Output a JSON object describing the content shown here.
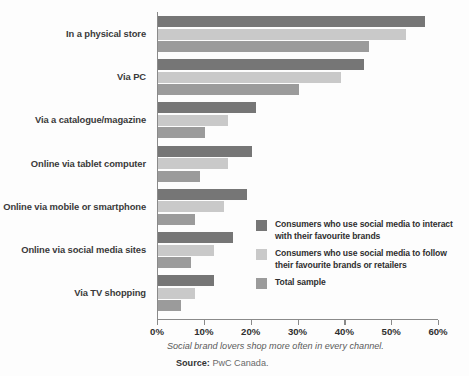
{
  "chart_data": {
    "type": "bar",
    "orientation": "horizontal",
    "title": "",
    "subtitle": "",
    "xlabel": "",
    "ylabel": "",
    "xlim": [
      0,
      60
    ],
    "xticks": [
      0,
      10,
      20,
      30,
      40,
      50,
      60
    ],
    "xtick_labels": [
      "0%",
      "10%",
      "20%",
      "30%",
      "40%",
      "50%",
      "60%"
    ],
    "grid": false,
    "legend_position": "inside-right-middle",
    "categories": [
      "In a physical store",
      "Via PC",
      "Via a catalogue/magazine",
      "Online via tablet computer",
      "Online via mobile or smartphone",
      "Online via social media sites",
      "Via TV shopping"
    ],
    "series": [
      {
        "name": "Consumers who use social media to interact with their favourite brands",
        "color": "#767676",
        "values": [
          57,
          44,
          21,
          20,
          19,
          16,
          12
        ]
      },
      {
        "name": "Consumers who use social media to follow their favourite brands or retailers",
        "color": "#c9c9c9",
        "values": [
          53,
          39,
          15,
          15,
          14,
          12,
          8
        ]
      },
      {
        "name": "Total sample",
        "color": "#9b9b9b",
        "values": [
          45,
          30,
          10,
          9,
          8,
          7,
          5
        ]
      }
    ],
    "caption": "Social brand lovers shop more often in every channel.",
    "source_label": "Source:",
    "source_value": "PwC Canada."
  },
  "legend": {
    "items": [
      {
        "label": "Consumers who use social media to interact with their favourite brands",
        "color": "#767676"
      },
      {
        "label": "Consumers who use social media to follow their favourite brands or retailers",
        "color": "#c9c9c9"
      },
      {
        "label": "Total sample",
        "color": "#9b9b9b"
      }
    ]
  }
}
